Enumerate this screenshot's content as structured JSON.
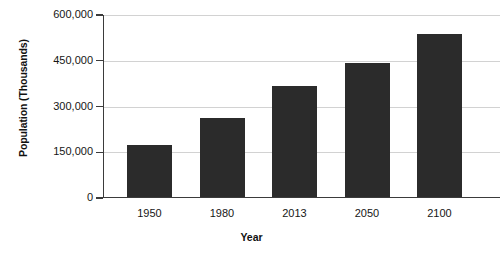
{
  "chart_data": {
    "type": "bar",
    "title": "",
    "xlabel": "Year",
    "ylabel": "Population (Thousands)",
    "categories": [
      "1950",
      "1980",
      "2013",
      "2050",
      "2100"
    ],
    "values": [
      170000,
      258000,
      365000,
      440000,
      533000
    ],
    "ylim": [
      0,
      600000
    ],
    "ytick_values": [
      0,
      150000,
      300000,
      450000,
      600000
    ],
    "ytick_labels": [
      "0",
      "150,000",
      "300,000",
      "450,000",
      "600,000"
    ],
    "grid": true,
    "legend": "none",
    "bar_color": "#2b2b2b",
    "gridline_color": "#d2d2d2",
    "axis_color": "#3b3b3b",
    "background_color": "#ffffff"
  }
}
